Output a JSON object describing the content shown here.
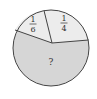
{
  "diagram": {
    "type": "pie-fraction",
    "sectors": [
      {
        "label_num": "1",
        "label_den": "6",
        "fraction": "1/6",
        "fill": "#ececec"
      },
      {
        "label_num": "1",
        "label_den": "4",
        "fraction": "1/4",
        "fill": "#ececec"
      },
      {
        "label": "?",
        "fill": "#d6d6d6"
      }
    ],
    "stroke_color": "#444444"
  }
}
